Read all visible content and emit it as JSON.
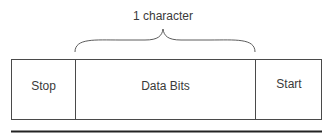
{
  "diagram": {
    "brace_label": "1 character",
    "fields": [
      {
        "label": "Stop"
      },
      {
        "label": "Data Bits"
      },
      {
        "label": "Start"
      }
    ],
    "colors": {
      "line": "#4a4a4a",
      "text": "#3a3a3a",
      "background": "#ffffff"
    }
  }
}
